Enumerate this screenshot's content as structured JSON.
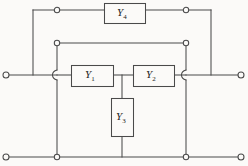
{
  "diagram": {
    "type": "electrical-circuit-schematic",
    "canvas": {
      "width": 248,
      "height": 166
    },
    "colors": {
      "background": "#fbfaf8",
      "wire": "#4a4a4a",
      "label_text": "#1b1b1b",
      "box_fill": "#fbfaf8"
    },
    "components": [
      {
        "id": "y1",
        "label": "Y",
        "subscript": "1",
        "orientation": "horizontal",
        "box": {
          "x": 71,
          "y": 65,
          "width": 42,
          "height": 21
        },
        "label_pos": {
          "x": 85,
          "y": 69
        }
      },
      {
        "id": "y2",
        "label": "Y",
        "subscript": "2",
        "orientation": "horizontal",
        "box": {
          "x": 133,
          "y": 65,
          "width": 41,
          "height": 21
        },
        "label_pos": {
          "x": 146,
          "y": 69
        }
      },
      {
        "id": "y3",
        "label": "Y",
        "subscript": "3",
        "orientation": "vertical",
        "box": {
          "x": 111,
          "y": 98,
          "width": 22,
          "height": 38
        },
        "label_pos": {
          "x": 116,
          "y": 111
        }
      },
      {
        "id": "y4",
        "label": "Y",
        "subscript": "4",
        "orientation": "horizontal",
        "box": {
          "x": 104,
          "y": 3,
          "width": 41,
          "height": 20
        },
        "label_pos": {
          "x": 117,
          "y": 7
        }
      }
    ],
    "terminals": [
      {
        "id": "input-top",
        "x": 6,
        "y": 75
      },
      {
        "id": "input-bottom",
        "x": 6,
        "y": 157
      },
      {
        "id": "output-top",
        "x": 241,
        "y": 75
      },
      {
        "id": "output-bottom",
        "x": 241,
        "y": 157
      }
    ],
    "junction_nodes": [
      {
        "id": "node-top-left",
        "x": 57,
        "y": 10
      },
      {
        "id": "node-top-right",
        "x": 186,
        "y": 10
      },
      {
        "id": "node-rail2-left",
        "x": 57,
        "y": 43
      },
      {
        "id": "node-rail2-right",
        "x": 186,
        "y": 43
      },
      {
        "id": "node-bottom-left",
        "x": 57,
        "y": 157
      },
      {
        "id": "node-bottom-right",
        "x": 186,
        "y": 157
      }
    ],
    "wire_segments": [
      {
        "id": "top-rail-left",
        "d": "M 33 10 L 104 10"
      },
      {
        "id": "top-rail-right",
        "d": "M 145 10 L 211 10"
      },
      {
        "id": "left-bridge-vertical",
        "d": "M 33 10 L 33 75"
      },
      {
        "id": "right-bridge-vertical",
        "d": "M 211 10 L 211 75"
      },
      {
        "id": "rail2-horizontal",
        "d": "M 57 43 L 186 43"
      },
      {
        "id": "left-trunk-vertical",
        "d": "M 57 43 L 57 70"
      },
      {
        "id": "left-trunk-vertical-lower",
        "d": "M 57 80 L 57 157"
      },
      {
        "id": "right-trunk-vertical",
        "d": "M 186 43 L 186 70"
      },
      {
        "id": "right-trunk-vertical-lower",
        "d": "M 186 80 L 186 157"
      },
      {
        "id": "in-lead",
        "d": "M 6 75 L 57 75"
      },
      {
        "id": "y1-left-lead",
        "d": "M 57 75 L 71 75"
      },
      {
        "id": "y1-to-y2-lead",
        "d": "M 113 75 L 133 75"
      },
      {
        "id": "y2-right-lead",
        "d": "M 174 75 L 186 75"
      },
      {
        "id": "out-lead",
        "d": "M 186 75 L 241 75"
      },
      {
        "id": "y3-top-lead",
        "d": "M 122 75 L 122 98"
      },
      {
        "id": "y3-bottom-lead",
        "d": "M 122 136 L 122 157"
      },
      {
        "id": "bottom-rail",
        "d": "M 6 157 L 241 157"
      }
    ],
    "wire_hops": [
      {
        "id": "hop-left",
        "d": "M 57 70 C 51 72, 51 78, 57 80"
      },
      {
        "id": "hop-right",
        "d": "M 186 70 C 180 72, 180 78, 186 80"
      }
    ]
  }
}
